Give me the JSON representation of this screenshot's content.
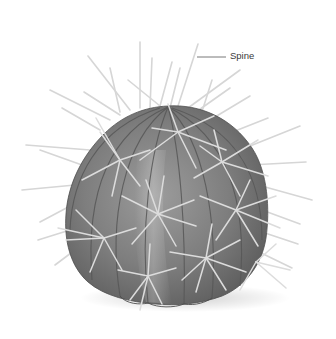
{
  "figure": {
    "colors": {
      "background": "#ffffff",
      "body_dark": "#5e5e5e",
      "body_mid": "#7c7c7c",
      "body_light": "#a2a2a2",
      "rib_line": "#555555",
      "spine": "#d9d9d9",
      "leader_line": "#555555",
      "label_text": "#3a3a3a"
    }
  },
  "labels": [
    {
      "id": "spine",
      "text": "Spine",
      "anchor": [
        198,
        57
      ],
      "label_position": [
        230,
        57
      ]
    }
  ]
}
